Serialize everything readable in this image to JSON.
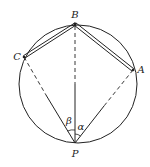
{
  "diagram": {
    "type": "geometry",
    "colors": {
      "stroke": "#222222",
      "background": "#ffffff"
    },
    "circle": {
      "cx": 78,
      "cy": 84,
      "r": 59
    },
    "points": {
      "B": {
        "x": 75,
        "y": 24,
        "label": "B"
      },
      "C": {
        "x": 24,
        "y": 57,
        "label": "C"
      },
      "A": {
        "x": 133,
        "y": 70,
        "label": "A"
      },
      "P": {
        "x": 75,
        "y": 143,
        "label": "P"
      }
    },
    "angles": {
      "beta": {
        "label": "β",
        "between": [
          "PC",
          "PB"
        ]
      },
      "alpha": {
        "label": "α",
        "between": [
          "PB",
          "PA"
        ]
      }
    },
    "segments": [
      {
        "from": "B",
        "to": "C",
        "style": "double"
      },
      {
        "from": "B",
        "to": "A",
        "style": "double"
      },
      {
        "from": "C",
        "to": "P",
        "style": "dashed-then-solid"
      },
      {
        "from": "A",
        "to": "P",
        "style": "dashed-then-solid"
      },
      {
        "from": "B",
        "to": "P",
        "style": "dashed-then-solid"
      }
    ]
  },
  "labels": {
    "B": "B",
    "C": "C",
    "A": "A",
    "P": "P",
    "beta": "β",
    "alpha": "α"
  }
}
